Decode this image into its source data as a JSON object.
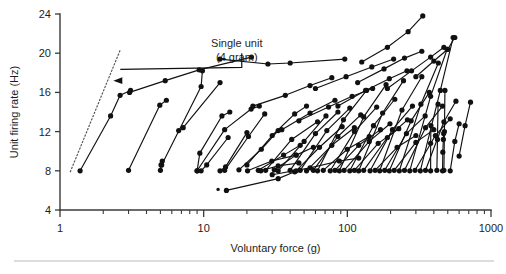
{
  "figure": {
    "name": "unit-firing-rate-vs-voluntary-force",
    "background_color": "#ffffff",
    "ink_color": "#111111",
    "axis_color": "#3a3a3a",
    "footer_rule_color": "#b9b9b9"
  },
  "chart_data": {
    "type": "line",
    "title": "",
    "subtitle": "",
    "xlabel": "Voluntary force (g)",
    "ylabel": "Unit firing rate (Hz)",
    "x_scale": "log",
    "y_scale": "linear",
    "xlim": [
      1,
      1000
    ],
    "ylim": [
      4,
      24
    ],
    "grid": false,
    "legend": null,
    "x_ticks": [
      1,
      10,
      100,
      1000
    ],
    "x_tick_labels": [
      "1",
      "10",
      "100",
      "1000"
    ],
    "x_minor_ticks": [
      2,
      3,
      4,
      5,
      6,
      7,
      8,
      9,
      20,
      30,
      40,
      50,
      60,
      70,
      80,
      90,
      200,
      300,
      400,
      500,
      600,
      700,
      800,
      900
    ],
    "y_ticks": [
      4,
      8,
      12,
      16,
      20,
      24
    ],
    "y_tick_labels": [
      "4",
      "8",
      "12",
      "16",
      "20",
      "24"
    ],
    "marker": "filled-circle",
    "marker_size": 2.6,
    "annotations": [
      {
        "name": "single-unit-annotation",
        "text_lines": [
          "Single unit",
          "(4 gram)"
        ],
        "x_text": 17.0,
        "y_text": 20.6,
        "arrow_to_x": 2.35,
        "arrow_to_y": 17.2,
        "style": "elbow-arrow"
      }
    ],
    "reference_lines": [
      {
        "name": "single-unit-reference",
        "style": "dotted",
        "points": [
          [
            1.18,
            7.9
          ],
          [
            2.62,
            20.3
          ]
        ]
      }
    ],
    "stray_points": [
      {
        "name": "stray-marker-low",
        "x": 12.6,
        "y": 6.1
      }
    ],
    "series": [
      {
        "name": "unit-01",
        "points": [
          [
            1.38,
            8.0
          ],
          [
            2.25,
            13.6
          ],
          [
            2.62,
            15.7
          ],
          [
            3.1,
            16.2
          ]
        ]
      },
      {
        "name": "unit-02",
        "points": [
          [
            3.0,
            8.05
          ],
          [
            4.95,
            14.7
          ],
          [
            5.5,
            15.2
          ]
        ]
      },
      {
        "name": "unit-03",
        "points": [
          [
            3.05,
            16.0
          ],
          [
            5.4,
            17.2
          ],
          [
            9.3,
            18.3
          ],
          [
            21.5,
            19.6
          ]
        ]
      },
      {
        "name": "unit-04",
        "points": [
          [
            5.0,
            8.05
          ],
          [
            5.05,
            8.6
          ],
          [
            5.15,
            9.0
          ]
        ]
      },
      {
        "name": "unit-05",
        "points": [
          [
            5.1,
            8.6
          ],
          [
            9.6,
            16.6
          ],
          [
            9.8,
            18.2
          ]
        ]
      },
      {
        "name": "unit-06",
        "points": [
          [
            6.7,
            12.1
          ],
          [
            7.2,
            12.4
          ],
          [
            13.0,
            17.0
          ]
        ]
      },
      {
        "name": "unit-07",
        "points": [
          [
            9.0,
            8.0
          ],
          [
            9.4,
            9.8
          ],
          [
            13.4,
            13.6
          ],
          [
            15.2,
            14.0
          ]
        ]
      },
      {
        "name": "unit-08",
        "points": [
          [
            9.6,
            8.0
          ],
          [
            10.5,
            8.6
          ],
          [
            14.8,
            11.4
          ]
        ]
      },
      {
        "name": "unit-09",
        "points": [
          [
            9.0,
            8.0
          ],
          [
            14.0,
            12.2
          ],
          [
            21.4,
            14.3
          ],
          [
            24.4,
            14.6
          ]
        ]
      },
      {
        "name": "unit-10",
        "points": [
          [
            13.0,
            8.0
          ],
          [
            14.2,
            8.4
          ],
          [
            20.0,
            11.9
          ]
        ]
      },
      {
        "name": "unit-11",
        "points": [
          [
            14.0,
            8.05
          ],
          [
            20.5,
            11.5
          ],
          [
            26.6,
            13.8
          ]
        ]
      },
      {
        "name": "unit-12",
        "points": [
          [
            14.4,
            6.0
          ],
          [
            33.0,
            7.2
          ],
          [
            43.0,
            7.9
          ]
        ]
      },
      {
        "name": "unit-13",
        "points": [
          [
            17.6,
            8.1
          ],
          [
            25.2,
            10.2
          ],
          [
            33.0,
            12.1
          ]
        ]
      },
      {
        "name": "unit-14",
        "points": [
          [
            20.2,
            8.0
          ],
          [
            29.8,
            9.0
          ],
          [
            44.0,
            9.6
          ]
        ]
      },
      {
        "name": "unit-15",
        "points": [
          [
            13.0,
            19.4
          ],
          [
            28.0,
            18.9
          ],
          [
            40.0,
            19.0
          ],
          [
            96.0,
            19.4
          ]
        ]
      },
      {
        "name": "unit-16",
        "points": [
          [
            20.0,
            8.6
          ],
          [
            30.0,
            11.6
          ],
          [
            43.0,
            13.8
          ],
          [
            52.0,
            14.6
          ]
        ]
      },
      {
        "name": "unit-17",
        "points": [
          [
            24.0,
            8.05
          ],
          [
            36.0,
            9.6
          ],
          [
            47.0,
            10.6
          ]
        ]
      },
      {
        "name": "unit-18",
        "points": [
          [
            25.0,
            8.0
          ],
          [
            33.0,
            8.5
          ],
          [
            46.0,
            8.8
          ]
        ]
      },
      {
        "name": "unit-19",
        "points": [
          [
            27.0,
            8.05
          ],
          [
            41.0,
            11.2
          ],
          [
            62.0,
            13.0
          ]
        ]
      },
      {
        "name": "unit-20",
        "points": [
          [
            22.0,
            14.6
          ],
          [
            37.0,
            15.7
          ],
          [
            55.0,
            16.7
          ],
          [
            78.0,
            17.5
          ]
        ]
      },
      {
        "name": "unit-21",
        "points": [
          [
            31.0,
            8.1
          ],
          [
            44.0,
            9.6
          ],
          [
            58.0,
            10.4
          ]
        ]
      },
      {
        "name": "unit-22",
        "points": [
          [
            33.0,
            8.0
          ],
          [
            50.0,
            11.0
          ],
          [
            71.0,
            13.6
          ]
        ]
      },
      {
        "name": "unit-23",
        "points": [
          [
            35.0,
            12.2
          ],
          [
            55.0,
            13.9
          ],
          [
            82.0,
            15.2
          ]
        ]
      },
      {
        "name": "unit-24",
        "points": [
          [
            30.0,
            7.6
          ],
          [
            55.0,
            8.3
          ],
          [
            88.0,
            9.0
          ],
          [
            120.0,
            9.3
          ]
        ]
      },
      {
        "name": "unit-25",
        "points": [
          [
            40.0,
            8.05
          ],
          [
            60.0,
            11.8
          ],
          [
            86.0,
            14.0
          ]
        ]
      },
      {
        "name": "unit-26",
        "points": [
          [
            44.0,
            8.0
          ],
          [
            64.0,
            10.4
          ],
          [
            92.0,
            12.5
          ]
        ]
      },
      {
        "name": "unit-27",
        "points": [
          [
            47.0,
            8.05
          ],
          [
            72.0,
            12.1
          ],
          [
            104.0,
            14.4
          ]
        ]
      },
      {
        "name": "unit-28",
        "points": [
          [
            52.0,
            8.0
          ],
          [
            78.0,
            10.6
          ],
          [
            112.0,
            12.4
          ]
        ]
      },
      {
        "name": "unit-29",
        "points": [
          [
            46.0,
            13.1
          ],
          [
            74.0,
            14.5
          ],
          [
            108.0,
            15.6
          ],
          [
            150.0,
            16.4
          ]
        ]
      },
      {
        "name": "unit-30",
        "points": [
          [
            58.0,
            8.05
          ],
          [
            86.0,
            11.5
          ],
          [
            124.0,
            13.7
          ]
        ]
      },
      {
        "name": "unit-31",
        "points": [
          [
            62.0,
            8.0
          ],
          [
            94.0,
            13.2
          ],
          [
            136.0,
            16.2
          ]
        ]
      },
      {
        "name": "unit-32",
        "points": [
          [
            68.0,
            8.05
          ],
          [
            100.0,
            10.2
          ],
          [
            142.0,
            11.5
          ]
        ]
      },
      {
        "name": "unit-33",
        "points": [
          [
            60.0,
            16.4
          ],
          [
            98.0,
            17.6
          ],
          [
            148.0,
            18.6
          ],
          [
            210.0,
            19.4
          ]
        ]
      },
      {
        "name": "unit-34",
        "points": [
          [
            76.0,
            8.0
          ],
          [
            112.0,
            12.0
          ],
          [
            160.0,
            14.5
          ]
        ]
      },
      {
        "name": "unit-35",
        "points": [
          [
            82.0,
            8.05
          ],
          [
            120.0,
            10.6
          ],
          [
            170.0,
            12.2
          ]
        ]
      },
      {
        "name": "unit-36",
        "points": [
          [
            88.0,
            8.0
          ],
          [
            130.0,
            13.5
          ],
          [
            186.0,
            16.8
          ]
        ]
      },
      {
        "name": "unit-37",
        "points": [
          [
            95.0,
            8.05
          ],
          [
            142.0,
            11.0
          ],
          [
            198.0,
            12.8
          ]
        ]
      },
      {
        "name": "unit-38",
        "points": [
          [
            86.0,
            14.6
          ],
          [
            134.0,
            16.2
          ],
          [
            196.0,
            17.4
          ],
          [
            260.0,
            18.2
          ]
        ]
      },
      {
        "name": "unit-39",
        "points": [
          [
            104.0,
            8.0
          ],
          [
            152.0,
            12.6
          ],
          [
            214.0,
            15.3
          ]
        ]
      },
      {
        "name": "unit-40",
        "points": [
          [
            112.0,
            8.05
          ],
          [
            164.0,
            10.8
          ],
          [
            228.0,
            12.3
          ]
        ]
      },
      {
        "name": "unit-41",
        "points": [
          [
            120.0,
            8.0
          ],
          [
            176.0,
            13.9
          ],
          [
            246.0,
            17.2
          ]
        ]
      },
      {
        "name": "unit-42",
        "points": [
          [
            130.0,
            8.05
          ],
          [
            190.0,
            11.4
          ],
          [
            262.0,
            13.2
          ]
        ]
      },
      {
        "name": "unit-43",
        "points": [
          [
            118.0,
            17.0
          ],
          [
            180.0,
            18.4
          ],
          [
            250.0,
            19.5
          ],
          [
            330.0,
            20.2
          ]
        ]
      },
      {
        "name": "unit-44",
        "points": [
          [
            126.0,
            19.1
          ],
          [
            190.0,
            20.6
          ],
          [
            265.0,
            22.2
          ],
          [
            335.0,
            23.8
          ]
        ]
      },
      {
        "name": "unit-45",
        "points": [
          [
            144.0,
            8.0
          ],
          [
            206.0,
            12.2
          ],
          [
            284.0,
            14.6
          ]
        ]
      },
      {
        "name": "unit-46",
        "points": [
          [
            156.0,
            8.05
          ],
          [
            222.0,
            10.4
          ],
          [
            300.0,
            11.6
          ]
        ]
      },
      {
        "name": "unit-47",
        "points": [
          [
            168.0,
            8.0
          ],
          [
            240.0,
            14.2
          ],
          [
            330.0,
            17.6
          ]
        ]
      },
      {
        "name": "unit-48",
        "points": [
          [
            182.0,
            8.05
          ],
          [
            258.0,
            11.8
          ],
          [
            348.0,
            13.6
          ]
        ]
      },
      {
        "name": "unit-49",
        "points": [
          [
            196.0,
            8.0
          ],
          [
            278.0,
            13.1
          ],
          [
            372.0,
            16.0
          ]
        ]
      },
      {
        "name": "unit-50",
        "points": [
          [
            212.0,
            8.05
          ],
          [
            300.0,
            10.9
          ],
          [
            400.0,
            12.2
          ]
        ]
      },
      {
        "name": "unit-51",
        "points": [
          [
            190.0,
            16.4
          ],
          [
            280.0,
            18.2
          ],
          [
            380.0,
            19.6
          ],
          [
            470.0,
            20.6
          ]
        ]
      },
      {
        "name": "unit-52",
        "points": [
          [
            230.0,
            8.0
          ],
          [
            325.0,
            14.8
          ],
          [
            430.0,
            19.0
          ]
        ]
      },
      {
        "name": "unit-53",
        "points": [
          [
            250.0,
            8.05
          ],
          [
            350.0,
            12.4
          ],
          [
            460.0,
            14.6
          ]
        ]
      },
      {
        "name": "unit-54",
        "points": [
          [
            272.0,
            8.0
          ],
          [
            380.0,
            15.6
          ],
          [
            495.0,
            20.4
          ]
        ]
      },
      {
        "name": "unit-55",
        "points": [
          [
            296.0,
            8.05
          ],
          [
            410.0,
            11.6
          ],
          [
            520.0,
            13.3
          ]
        ]
      },
      {
        "name": "unit-56",
        "points": [
          [
            322.0,
            8.0
          ],
          [
            444.0,
            16.2
          ],
          [
            545.0,
            21.6
          ]
        ]
      },
      {
        "name": "unit-57",
        "points": [
          [
            350.0,
            8.05
          ],
          [
            470.0,
            13.0
          ],
          [
            570.0,
            15.1
          ]
        ]
      },
      {
        "name": "unit-58",
        "points": [
          [
            300.0,
            17.6
          ],
          [
            400.0,
            19.2
          ],
          [
            500.0,
            20.4
          ],
          [
            560.0,
            21.6
          ]
        ]
      },
      {
        "name": "unit-59",
        "points": [
          [
            380.0,
            8.0
          ],
          [
            380.0,
            10.8
          ],
          [
            382.0,
            12.6
          ]
        ]
      },
      {
        "name": "unit-60",
        "points": [
          [
            420.0,
            8.05
          ],
          [
            424.0,
            11.2
          ],
          [
            428.0,
            14.8
          ]
        ]
      },
      {
        "name": "unit-61",
        "points": [
          [
            460.0,
            8.0
          ],
          [
            462.0,
            9.9
          ],
          [
            466.0,
            11.2
          ],
          [
            468.0,
            11.8
          ]
        ]
      },
      {
        "name": "unit-62",
        "points": [
          [
            470.0,
            8.05
          ],
          [
            474.0,
            12.0
          ],
          [
            478.0,
            16.2
          ]
        ]
      },
      {
        "name": "unit-63",
        "points": [
          [
            520.0,
            8.0
          ],
          [
            560.0,
            11.0
          ],
          [
            600.0,
            12.8
          ]
        ]
      },
      {
        "name": "unit-64",
        "points": [
          [
            600.0,
            9.5
          ],
          [
            660.0,
            12.6
          ],
          [
            720.0,
            15.0
          ]
        ]
      }
    ]
  }
}
